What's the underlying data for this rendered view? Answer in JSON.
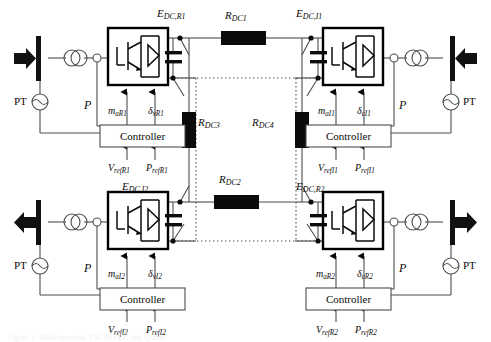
{
  "figure": {
    "caption": "Figure 1. Multi-terminal VSC-HVDC test system."
  },
  "colors": {
    "line": "#4d4d4d",
    "ink": "#0b0b0b",
    "fill_black": "#000000",
    "box_fill": "#ffffff",
    "dotted": "#9a9a9a"
  },
  "terminals": [
    {
      "id": "R1",
      "position": "top-left",
      "bus_label": "PT",
      "power_label": "P",
      "dc_node_label": {
        "base": "E",
        "sub": "DC,R1"
      },
      "controller_label": "Controller",
      "inputs_top": [
        {
          "base": "m",
          "sub": "aR1"
        },
        {
          "base": "δ",
          "sub": "vR1"
        }
      ],
      "inputs_bottom": [
        {
          "base": "V",
          "sub": "refR1"
        },
        {
          "base": "P",
          "sub": "refR1"
        }
      ],
      "arrow_direction": "into-bus"
    },
    {
      "id": "I1",
      "position": "top-right",
      "bus_label": "PT",
      "power_label": "P",
      "dc_node_label": {
        "base": "E",
        "sub": "DC,I1"
      },
      "controller_label": "Controller",
      "inputs_top": [
        {
          "base": "m",
          "sub": "aI1"
        },
        {
          "base": "δ",
          "sub": "cI1"
        }
      ],
      "inputs_bottom": [
        {
          "base": "V",
          "sub": "refI1"
        },
        {
          "base": "P",
          "sub": "refI1"
        }
      ],
      "arrow_direction": "out-of-bus"
    },
    {
      "id": "I2",
      "position": "bottom-left",
      "bus_label": "PT",
      "power_label": "P",
      "dc_node_label": {
        "base": "E",
        "sub": "DC,I2"
      },
      "controller_label": "Controller",
      "inputs_top": [
        {
          "base": "m",
          "sub": "aI2"
        },
        {
          "base": "δ",
          "sub": "vI2"
        }
      ],
      "inputs_bottom": [
        {
          "base": "V",
          "sub": "refI2"
        },
        {
          "base": "P",
          "sub": "refI2"
        }
      ],
      "arrow_direction": "out-of-bus"
    },
    {
      "id": "R2",
      "position": "bottom-right",
      "bus_label": "PT",
      "power_label": "P",
      "dc_node_label": {
        "base": "E",
        "sub": "DC,R2"
      },
      "controller_label": "Controller",
      "inputs_top": [
        {
          "base": "m",
          "sub": "aR2"
        },
        {
          "base": "δ",
          "sub": "cR2"
        }
      ],
      "inputs_bottom": [
        {
          "base": "V",
          "sub": "refR2"
        },
        {
          "base": "P",
          "sub": "refR2"
        }
      ],
      "arrow_direction": "into-bus"
    }
  ],
  "dc_resistors": [
    {
      "id": "RDC1",
      "base": "R",
      "sub": "DC1",
      "orientation": "horizontal",
      "location": "top-link"
    },
    {
      "id": "RDC2",
      "base": "R",
      "sub": "DC2",
      "orientation": "horizontal",
      "location": "bottom-link"
    },
    {
      "id": "RDC3",
      "base": "R",
      "sub": "DC3",
      "orientation": "vertical",
      "location": "left-link"
    },
    {
      "id": "RDC4",
      "base": "R",
      "sub": "DC4",
      "orientation": "vertical",
      "location": "right-link"
    }
  ],
  "components": {
    "converter_symbol": "igbt-with-antiparallel-diode",
    "capacitor_symbol": "dc-link-capacitor",
    "transformer_symbol": "two-winding-transformer",
    "pt_symbol": "potential-transformer",
    "bus_symbol": "ac-busbar"
  }
}
